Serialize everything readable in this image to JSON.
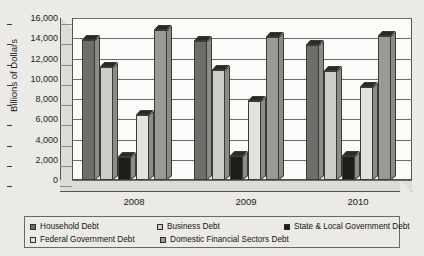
{
  "chart_data": {
    "type": "bar",
    "title": "",
    "xlabel": "",
    "ylabel": "Billions of Dollars",
    "categories": [
      "2008",
      "2009",
      "2010"
    ],
    "ylim": [
      0,
      16000
    ],
    "ytick_step": 2000,
    "ytick_labels": [
      "16,000",
      "14,000",
      "12,000",
      "10,000",
      "8,000",
      "6,000",
      "4,000",
      "2,000",
      "0"
    ],
    "ytick_values": [
      16000,
      14000,
      12000,
      10000,
      8000,
      6000,
      4000,
      2000,
      0
    ],
    "grid": true,
    "legend_position": "bottom",
    "style": "3d-column",
    "series": [
      {
        "name": "Household Debt",
        "color": "#6f6d69",
        "values": [
          13800,
          13700,
          13300
        ]
      },
      {
        "name": "Business Debt",
        "color": "#cfcdc9",
        "values": [
          11200,
          10900,
          10800
        ]
      },
      {
        "name": "State & Local Government Debt",
        "color": "#1e1d1b",
        "values": [
          2300,
          2400,
          2400
        ]
      },
      {
        "name": "Federal Government Debt",
        "color": "#e4e2de",
        "values": [
          6400,
          7800,
          9200
        ]
      },
      {
        "name": "Domestic Financial Sectors Debt",
        "color": "#9b9995",
        "values": [
          14800,
          14100,
          14200
        ]
      }
    ]
  },
  "legend": {
    "items": [
      {
        "label": "Household Debt",
        "color": "#6f6d69"
      },
      {
        "label": "Business Debt",
        "color": "#cfcdc9"
      },
      {
        "label": "State & Local Government Debt",
        "color": "#1e1d1b"
      },
      {
        "label": "Federal Government Debt",
        "color": "#e4e2de"
      },
      {
        "label": "Domestic Financial Sectors Debt",
        "color": "#9b9995"
      }
    ]
  }
}
